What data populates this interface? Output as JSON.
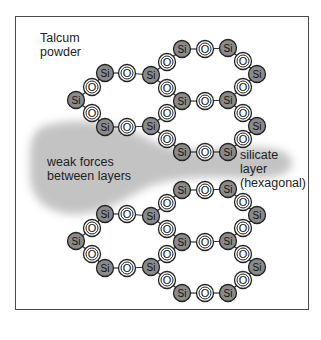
{
  "title": {
    "line1": "Talcum",
    "line2": "powder"
  },
  "annotations": {
    "weak_forces": {
      "line1": "weak forces",
      "line2": "between layers"
    },
    "silicate_layer": {
      "line1": "silicate",
      "line2": "layer",
      "line3": "(hexagonal)"
    }
  },
  "atoms": {
    "silicon_label": "Si",
    "oxygen_label": "O",
    "silicon_color": "#8a8a8a",
    "oxygen_color": "#ffffff",
    "cloud_color": "#b8b8b8"
  }
}
